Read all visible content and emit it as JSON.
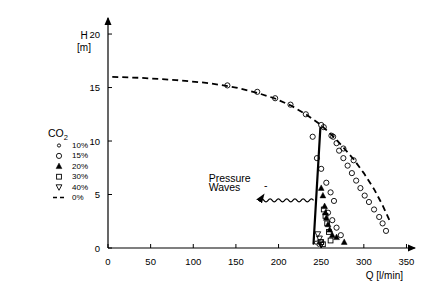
{
  "chart_data": {
    "type": "scatter",
    "title": "",
    "xlabel": "Q [l/min]",
    "ylabel": "H [m]",
    "ylabel_line1": "H",
    "ylabel_line2": "[m]",
    "xlim": [
      0,
      360
    ],
    "ylim": [
      0,
      21.5
    ],
    "xticks": [
      0,
      50,
      100,
      150,
      200,
      250,
      300,
      350
    ],
    "xticklabels": [
      "0",
      "50",
      "100",
      "150",
      "200",
      "250",
      "300",
      "350"
    ],
    "yticks": [
      0,
      5,
      10,
      15,
      20
    ],
    "yticklabels": [
      "0",
      "5",
      "10",
      "15",
      "20"
    ],
    "grid": false,
    "legend_position": "upper-left-inside",
    "legend_title": "CO2",
    "legend_title_main": "CO",
    "legend_title_sub": "2",
    "legend": [
      {
        "label": "10%",
        "marker": "small-open-circle"
      },
      {
        "label": "15%",
        "marker": "open-circle"
      },
      {
        "label": "20%",
        "marker": "filled-triangle-up"
      },
      {
        "label": "30%",
        "marker": "open-square"
      },
      {
        "label": "40%",
        "marker": "open-triangle-down"
      },
      {
        "label": "0%",
        "marker": "dashed-line"
      }
    ],
    "annotations": [
      {
        "text": "Pressure",
        "x": 118,
        "y": 6.2
      },
      {
        "text": "Waves",
        "x": 118,
        "y": 5.3
      },
      {
        "text": "-",
        "x": 183,
        "y": 5.5
      }
    ],
    "series": [
      {
        "name": "0%",
        "marker": "dashed-line",
        "type": "line",
        "x": [
          5,
          40,
          80,
          120,
          150,
          175,
          195,
          215,
          232,
          248,
          262,
          275,
          288,
          300,
          312,
          322,
          330
        ],
        "y": [
          16.0,
          15.9,
          15.7,
          15.4,
          15.0,
          14.5,
          14.0,
          13.3,
          12.5,
          11.6,
          10.6,
          9.5,
          8.3,
          7.0,
          5.5,
          4.0,
          2.6
        ]
      },
      {
        "name": "0%-points",
        "marker": "open-circle",
        "type": "scatter",
        "x": [
          140,
          175,
          196,
          214,
          232,
          250,
          264,
          276,
          288
        ],
        "y": [
          15.2,
          14.6,
          14.0,
          13.4,
          12.5,
          11.5,
          10.4,
          9.3,
          8.2
        ]
      },
      {
        "name": "15%",
        "marker": "open-circle",
        "type": "scatter",
        "x": [
          240,
          253,
          262,
          268,
          271,
          276,
          281,
          286,
          291,
          296,
          301,
          306,
          312,
          318,
          322,
          326,
          245,
          250,
          256,
          261,
          265,
          258,
          263,
          268,
          273
        ],
        "y": [
          10.4,
          11.3,
          10.5,
          9.8,
          9.1,
          8.4,
          7.7,
          7.0,
          6.3,
          5.6,
          4.9,
          4.3,
          3.6,
          2.9,
          2.3,
          1.6,
          8.4,
          7.4,
          6.1,
          5.2,
          4.4,
          3.3,
          2.6,
          1.9,
          1.2
        ]
      },
      {
        "name": "20%",
        "marker": "filled-triangle-up",
        "type": "scatter",
        "x": [
          250,
          252,
          254,
          255,
          256,
          258,
          260,
          263,
          268,
          277
        ],
        "y": [
          5.6,
          4.9,
          3.9,
          3.3,
          2.8,
          2.2,
          1.7,
          1.2,
          1.0,
          0.55
        ]
      },
      {
        "name": "30%",
        "marker": "open-square",
        "type": "scatter",
        "x": [
          253,
          255,
          257,
          259,
          261,
          250,
          252
        ],
        "y": [
          3.6,
          3.0,
          2.3,
          1.5,
          0.7,
          0.55,
          0.35
        ]
      },
      {
        "name": "40%",
        "marker": "open-triangle-down",
        "type": "scatter",
        "x": [
          246,
          248,
          249,
          250
        ],
        "y": [
          1.3,
          0.9,
          0.55,
          0.3
        ]
      },
      {
        "name": "10%",
        "marker": "small-open-circle",
        "type": "scatter",
        "x": [
          244,
          247
        ],
        "y": [
          0.5,
          0.3
        ]
      }
    ],
    "boundary_line": {
      "name": "pressure-wave-boundary",
      "x0": 249,
      "y0": 11.2,
      "x1": 241,
      "y1": 0.4
    },
    "wave_arrow": {
      "name": "pressure-wave-arrow",
      "x_start": 241,
      "x_end": 178,
      "y": 4.45
    }
  }
}
